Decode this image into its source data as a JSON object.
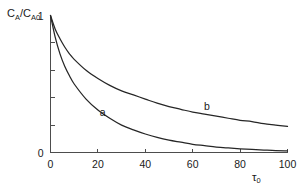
{
  "figure": {
    "background_color": "#ffffff",
    "axis_color": "#4d4d4d",
    "curve_color": "#262626"
  },
  "ylabel_parts": {
    "c1": "C",
    "sub1": "A",
    "slash": "/",
    "c2": "C",
    "sub2": "A",
    "sub3": "0"
  },
  "xlabel_parts": {
    "tau": "τ",
    "sub": "0"
  },
  "chart_data": {
    "type": "line",
    "title": "",
    "xlabel": "τ₀",
    "ylabel": "C_A/C_A0",
    "xlim": [
      0,
      100
    ],
    "ylim": [
      0,
      1
    ],
    "grid": false,
    "legend": "inline-curve-labels",
    "xticks": [
      0,
      20,
      40,
      60,
      80,
      100
    ],
    "xticklabels": [
      "0",
      "20",
      "40",
      "60",
      "80",
      "100"
    ],
    "yticks": [
      0,
      0.2,
      0.4,
      0.6,
      0.8,
      1.0
    ],
    "yticklabels_shown": {
      "bottom": "0",
      "top": "1"
    },
    "x": [
      0,
      2,
      4,
      6,
      8,
      10,
      15,
      20,
      25,
      30,
      35,
      40,
      45,
      50,
      55,
      60,
      65,
      70,
      75,
      80,
      85,
      90,
      95,
      100
    ],
    "series": [
      {
        "name": "a",
        "label": "a",
        "label_x": 22,
        "label_y": 0.27,
        "values": [
          1.0,
          0.84,
          0.72,
          0.63,
          0.56,
          0.5,
          0.39,
          0.31,
          0.25,
          0.2,
          0.165,
          0.135,
          0.11,
          0.09,
          0.075,
          0.06,
          0.05,
          0.04,
          0.033,
          0.027,
          0.022,
          0.018,
          0.014,
          0.012
        ]
      },
      {
        "name": "b",
        "label": "b",
        "label_x": 66,
        "label_y": 0.31,
        "values": [
          1.0,
          0.9,
          0.83,
          0.77,
          0.72,
          0.68,
          0.6,
          0.54,
          0.49,
          0.45,
          0.42,
          0.39,
          0.36,
          0.335,
          0.315,
          0.295,
          0.28,
          0.265,
          0.25,
          0.235,
          0.225,
          0.21,
          0.2,
          0.19
        ]
      }
    ]
  }
}
